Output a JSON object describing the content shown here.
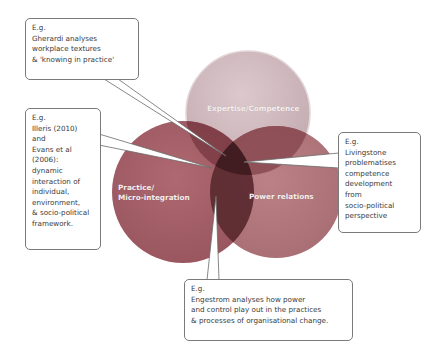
{
  "circles": {
    "top": {
      "label": "Expertise/Competence",
      "color": "#c9b3b8"
    },
    "left": {
      "label": "Practice/\nMicro-integration",
      "color": "#9e555e"
    },
    "right": {
      "label": "Power relations",
      "color": "#a96a70"
    },
    "center_overlap_color": "#4a2127"
  },
  "callouts": {
    "top": {
      "text": "E.g.\nGherardi analyses\nworkplace textures\n& 'knowing in practice'"
    },
    "left": {
      "text": "E.g.\nIlleris (2010)\nand\nEvans et al\n(2006):\ndynamic\ninteraction of\nindividual,\nenvironment,\n& socio-political\nframework."
    },
    "right": {
      "text": "E.g.\nLivingstone\nproblematises\ncompetence\ndevelopment\nfrom\nsocio-political\nperspective"
    },
    "bottom": {
      "text": "E.g.\nEngestrom analyses how power\nand control play out in the practices\n& processes of organisational change."
    }
  }
}
